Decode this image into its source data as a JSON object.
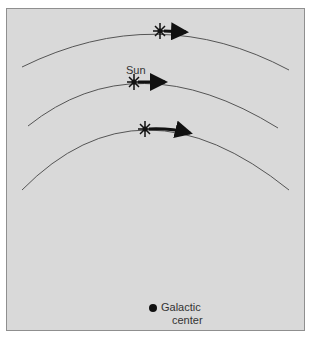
{
  "diagram": {
    "title": "",
    "labels": {
      "sun": "Sun",
      "galactic_center_line1": "Galactic",
      "galactic_center_line2": "center"
    },
    "orbits": [
      {
        "name": "outer-orbit",
        "has_star": true,
        "has_arrow": true
      },
      {
        "name": "sun-orbit",
        "has_star": true,
        "has_arrow": true,
        "label": "Sun"
      },
      {
        "name": "inner-orbit",
        "has_star": true,
        "has_arrow": true
      }
    ],
    "colors": {
      "background": "#d9d9d9",
      "stroke": "#555555",
      "arrow": "#111111",
      "text": "#333333"
    }
  }
}
